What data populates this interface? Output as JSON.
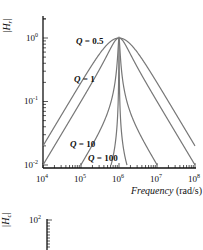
{
  "chart_data": [
    {
      "type": "line",
      "title": "",
      "xlabel": "Frequency (rad/s)",
      "ylabel": "|H_r|",
      "xscale": "log",
      "yscale": "log",
      "xlim": [
        10000,
        100000000
      ],
      "ylim": [
        0.01,
        2
      ],
      "x_ticks": [
        "10^4",
        "10^5",
        "10^6",
        "10^7",
        "10^8"
      ],
      "y_ticks": [
        "10^-2",
        "10^-1",
        "10^0"
      ],
      "center_frequency": 1000000,
      "series": [
        {
          "name": "Q = 0.5",
          "Q": 0.5,
          "peak": 1.0
        },
        {
          "name": "Q = 1",
          "Q": 1,
          "peak": 1.0
        },
        {
          "name": "Q = 10",
          "Q": 10,
          "peak": 1.0
        },
        {
          "name": "Q = 100",
          "Q": 100,
          "peak": 1.0
        }
      ],
      "annotations": [
        "Q = 0.5",
        "Q = 1",
        "Q = 10",
        "Q = 100"
      ],
      "grid": false
    },
    {
      "type": "line",
      "title": "",
      "ylabel": "|H_c|",
      "yscale": "log",
      "y_ticks": [
        "10^2"
      ],
      "partial": true
    }
  ],
  "labels": {
    "y_axis_top": "|H",
    "y_axis_top_sub": "r",
    "y_axis_top_end": "|",
    "y_axis_bottom": "|H",
    "y_axis_bottom_sub": "c",
    "y_axis_bottom_end": "|",
    "x_axis": "Frequency",
    "x_axis_unit": " (rad/s)",
    "q_labels": [
      "Q = 0.5",
      "Q = 1",
      "Q = 10",
      "Q = 100"
    ],
    "x_ticks": [
      {
        "base": "10",
        "exp": "4"
      },
      {
        "base": "10",
        "exp": "5"
      },
      {
        "base": "10",
        "exp": "6"
      },
      {
        "base": "10",
        "exp": "7"
      },
      {
        "base": "10",
        "exp": "8"
      }
    ],
    "y_ticks": [
      {
        "base": "10",
        "exp": "0"
      },
      {
        "base": "10",
        "exp": "-1"
      },
      {
        "base": "10",
        "exp": "-2"
      }
    ],
    "second_y_tick": {
      "base": "10",
      "exp": "2"
    }
  },
  "colors": {
    "curve": "#777777",
    "axis": "#111111"
  }
}
